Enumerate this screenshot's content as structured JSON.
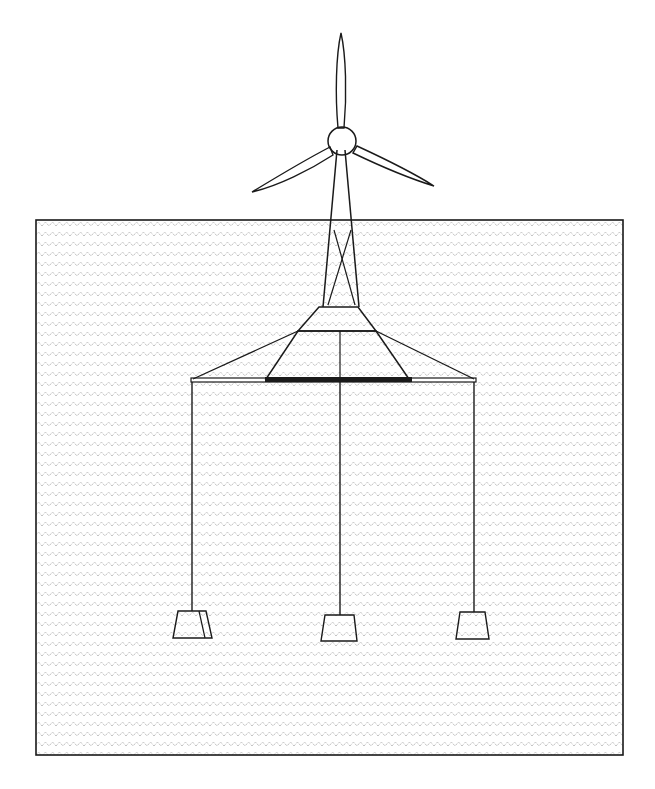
{
  "diagram": {
    "subject": "floating offshore wind turbine with tension-leg mooring",
    "components": [
      {
        "id": "rotor-hub",
        "shape": "circle"
      },
      {
        "id": "blade-top",
        "shape": "blade"
      },
      {
        "id": "blade-left",
        "shape": "blade"
      },
      {
        "id": "blade-right",
        "shape": "blade"
      },
      {
        "id": "tower",
        "shape": "lattice"
      },
      {
        "id": "floating-platform",
        "shape": "trapezoid"
      },
      {
        "id": "platform-deck",
        "shape": "bar"
      },
      {
        "id": "tendon-left",
        "shape": "line"
      },
      {
        "id": "tendon-center",
        "shape": "line"
      },
      {
        "id": "tendon-right",
        "shape": "line"
      },
      {
        "id": "anchor-left",
        "shape": "trapezoid"
      },
      {
        "id": "anchor-center",
        "shape": "trapezoid"
      },
      {
        "id": "anchor-right",
        "shape": "trapezoid"
      },
      {
        "id": "water-body",
        "shape": "rectangle"
      }
    ],
    "colors": {
      "stroke": "#1a1a1a",
      "blade_fill": "#a8a8a8",
      "anchor_fill": "#a0a0a0",
      "water_pattern": "#9a9a9a",
      "platform_fill": "#d8d8d8",
      "background": "#ffffff"
    }
  }
}
